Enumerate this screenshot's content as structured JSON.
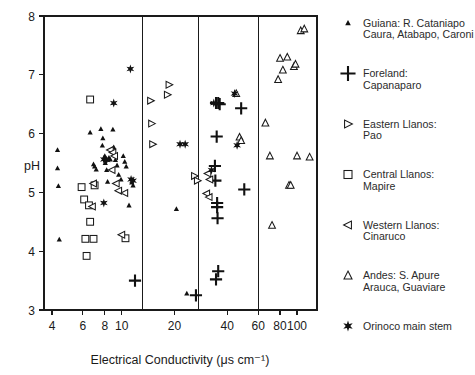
{
  "chart_data": {
    "type": "scatter",
    "title": "",
    "xlabel": "Electrical Conductivity (μs cm⁻¹)",
    "ylabel": "pH",
    "x_scale": "log",
    "xlim": [
      3.6,
      130
    ],
    "ylim": [
      3,
      8
    ],
    "grid": false,
    "legend_position": "right",
    "xticks": [
      4,
      6,
      8,
      10,
      20,
      40,
      60,
      80,
      100
    ],
    "xtick_labels": [
      "4",
      "6",
      "8",
      "10",
      "20",
      "40",
      "60",
      "80",
      "100"
    ],
    "yticks": [
      3,
      4,
      5,
      6,
      7,
      8
    ],
    "ytick_labels": [
      "3",
      "4",
      "5",
      "6",
      "7",
      "8"
    ],
    "vertical_dividers": [
      13.2,
      27.5,
      60
    ],
    "series": [
      {
        "name": "Guiana: R. Cataniapo Caura, Atabapo, Caroni",
        "marker": "triangle-up-filled",
        "points": [
          [
            4.3,
            5.72
          ],
          [
            4.3,
            5.41
          ],
          [
            4.35,
            5.11
          ],
          [
            4.4,
            4.2
          ],
          [
            6.6,
            6.02
          ],
          [
            6.9,
            5.48
          ],
          [
            7.0,
            5.44
          ],
          [
            7.15,
            5.39
          ],
          [
            7.6,
            6.08
          ],
          [
            7.8,
            5.92
          ],
          [
            7.75,
            5.8
          ],
          [
            8.0,
            5.62
          ],
          [
            8.05,
            5.5
          ],
          [
            8.2,
            5.38
          ],
          [
            8.3,
            5.18
          ],
          [
            8.45,
            5.59
          ],
          [
            8.6,
            5.56
          ],
          [
            8.9,
            6.07
          ],
          [
            9.0,
            5.77
          ],
          [
            9.1,
            5.66
          ],
          [
            9.2,
            5.55
          ],
          [
            9.4,
            5.46
          ],
          [
            9.6,
            5.3
          ],
          [
            9.9,
            5.22
          ],
          [
            10.2,
            5.62
          ],
          [
            10.4,
            5.52
          ],
          [
            10.6,
            5.44
          ],
          [
            11.0,
            4.78
          ],
          [
            11.4,
            5.17
          ],
          [
            11.6,
            5.12
          ],
          [
            20.5,
            4.72
          ],
          [
            23.5,
            3.28
          ]
        ]
      },
      {
        "name": "Foreland: Capanaparo",
        "marker": "plus",
        "points": [
          [
            11.9,
            3.5
          ],
          [
            26.5,
            3.25
          ],
          [
            34.5,
            6.52
          ],
          [
            35.5,
            6.52
          ],
          [
            36.2,
            6.5
          ],
          [
            34.8,
            5.95
          ],
          [
            34.0,
            5.45
          ],
          [
            34.2,
            5.2
          ],
          [
            35.0,
            4.82
          ],
          [
            35.0,
            4.75
          ],
          [
            35.2,
            4.56
          ],
          [
            35.5,
            3.66
          ],
          [
            34.5,
            3.52
          ],
          [
            48.0,
            6.43
          ],
          [
            50.0,
            5.05
          ]
        ]
      },
      {
        "name": "Eastern Llanos: Pao",
        "marker": "triangle-right-open",
        "points": [
          [
            14.6,
            6.56
          ],
          [
            14.8,
            6.17
          ],
          [
            15.0,
            5.82
          ],
          [
            18.6,
            6.83
          ],
          [
            18.2,
            6.66
          ],
          [
            26.0,
            5.28
          ],
          [
            27.0,
            5.2
          ]
        ]
      },
      {
        "name": "Central Llanos: Mapire",
        "marker": "square-open",
        "points": [
          [
            6.6,
            6.58
          ],
          [
            5.9,
            5.09
          ],
          [
            6.1,
            4.88
          ],
          [
            6.5,
            4.78
          ],
          [
            6.6,
            4.5
          ],
          [
            6.2,
            4.21
          ],
          [
            6.9,
            4.21
          ],
          [
            6.3,
            3.92
          ],
          [
            7.0,
            5.12
          ],
          [
            10.5,
            4.22
          ]
        ]
      },
      {
        "name": "Western Llanos: Cinaruco",
        "marker": "triangle-left-open",
        "points": [
          [
            8.6,
            5.72
          ],
          [
            8.9,
            5.68
          ],
          [
            9.1,
            5.62
          ],
          [
            8.8,
            5.38
          ],
          [
            6.9,
            5.15
          ],
          [
            9.3,
            5.15
          ],
          [
            9.6,
            5.03
          ],
          [
            10.4,
            4.99
          ],
          [
            6.8,
            4.76
          ],
          [
            10.0,
            4.28
          ],
          [
            31.0,
            5.32
          ],
          [
            31.8,
            5.22
          ],
          [
            30.5,
            4.98
          ],
          [
            31.5,
            4.92
          ]
        ]
      },
      {
        "name": "Andes: S. Apure Arauca, Guaviare",
        "marker": "triangle-up-open",
        "points": [
          [
            45.0,
            6.68
          ],
          [
            47.0,
            5.94
          ],
          [
            48.0,
            5.88
          ],
          [
            66.0,
            6.18
          ],
          [
            70.0,
            5.62
          ],
          [
            80.0,
            7.28
          ],
          [
            88.0,
            7.3
          ],
          [
            83.0,
            7.08
          ],
          [
            96.0,
            7.14
          ],
          [
            98.0,
            7.18
          ],
          [
            78.0,
            6.92
          ],
          [
            105.0,
            7.75
          ],
          [
            110.0,
            7.78
          ],
          [
            100.0,
            5.62
          ],
          [
            118.0,
            5.6
          ],
          [
            90.0,
            5.12
          ],
          [
            92.0,
            5.12
          ],
          [
            72.0,
            4.44
          ]
        ]
      },
      {
        "name": "Orinoco main stem",
        "marker": "star",
        "points": [
          [
            11.2,
            7.1
          ],
          [
            9.0,
            6.52
          ],
          [
            7.9,
            5.56
          ],
          [
            8.2,
            5.55
          ],
          [
            11.3,
            5.22
          ],
          [
            11.6,
            5.2
          ],
          [
            7.9,
            4.82
          ],
          [
            21.5,
            5.82
          ],
          [
            23.0,
            5.82
          ],
          [
            33.5,
            6.52
          ],
          [
            32.5,
            5.38
          ],
          [
            44.0,
            6.68
          ],
          [
            45.5,
            5.8
          ]
        ]
      }
    ]
  },
  "legend": {
    "entries": [
      {
        "marker": "triangle-up-filled",
        "line1": "Guiana: R. Cataniapo",
        "line2": "Caura, Atabapo, Caroni"
      },
      {
        "marker": "plus",
        "line1": "Foreland:",
        "line2": "Capanaparo"
      },
      {
        "marker": "triangle-right-open",
        "line1": "Eastern Llanos:",
        "line2": "Pao"
      },
      {
        "marker": "square-open",
        "line1": "Central Llanos:",
        "line2": "Mapire"
      },
      {
        "marker": "triangle-left-open",
        "line1": "Western Llanos:",
        "line2": "Cinaruco"
      },
      {
        "marker": "triangle-up-open",
        "line1": "Andes: S. Apure",
        "line2": "Arauca, Guaviare"
      },
      {
        "marker": "star",
        "line1": "Orinoco main stem",
        "line2": ""
      }
    ]
  },
  "colors": {
    "marker": "#111111",
    "axis": "#1a1a1a",
    "text": "#1a1a1a",
    "background": "#ffffff"
  }
}
